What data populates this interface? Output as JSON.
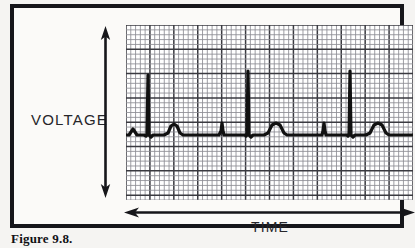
{
  "figure": {
    "caption": "Figure 9.8.",
    "y_axis_label": "VOLTAGE",
    "x_axis_label": "TIME",
    "y_arrow_icon": "double-headed-vertical-arrow-icon",
    "x_arrow_icon": "double-headed-horizontal-arrow-icon",
    "frame_color": "#16161a",
    "background_color": "#f5f4f2",
    "paper_color": "#ffffff",
    "trace_color": "#111111",
    "grid_minor_color": "#8d8d93",
    "grid_major_color": "#3a3a40"
  },
  "chart_data": {
    "type": "line",
    "title": "",
    "subtitle": "",
    "xlabel": "TIME",
    "ylabel": "VOLTAGE",
    "grid": true,
    "grid_minor_divisions_x": 60,
    "grid_minor_divisions_y": 36,
    "grid_major_every": 5,
    "legend": null,
    "axis_ticks_shown": false,
    "xlim": [
      0,
      287
    ],
    "ylim": [
      0,
      175
    ],
    "baseline_y": 110,
    "series": [
      {
        "name": "ECG waveform",
        "description": "Electrocardiogram trace: repeating P-QRS-T complexes with tall R spikes, rounded T waves and small intervening deflections",
        "beats": [
          {
            "r_spike_x": 22,
            "r_spike_height": 62,
            "t_wave_x": 48,
            "t_wave_height": 13,
            "small_spike_x": 0,
            "small_spike_height": 0
          },
          {
            "r_spike_x": 0,
            "r_spike_height": 0,
            "t_wave_x": 0,
            "t_wave_height": 0,
            "small_spike_x": 96,
            "small_spike_height": 12
          },
          {
            "r_spike_x": 122,
            "r_spike_height": 64,
            "t_wave_x": 150,
            "t_wave_height": 14,
            "small_spike_x": 0,
            "small_spike_height": 0
          },
          {
            "r_spike_x": 0,
            "r_spike_height": 0,
            "t_wave_x": 0,
            "t_wave_height": 0,
            "small_spike_x": 198,
            "small_spike_height": 12
          },
          {
            "r_spike_x": 224,
            "r_spike_height": 64,
            "t_wave_x": 252,
            "t_wave_height": 14,
            "small_spike_x": 0,
            "small_spike_height": 0
          }
        ],
        "points": [
          [
            0,
            110
          ],
          [
            3,
            110
          ],
          [
            5,
            107
          ],
          [
            7,
            104
          ],
          [
            9,
            107
          ],
          [
            11,
            110
          ],
          [
            14,
            110
          ],
          [
            18,
            110
          ],
          [
            20,
            111
          ],
          [
            21,
            110
          ],
          [
            22,
            50
          ],
          [
            23,
            110
          ],
          [
            25,
            112
          ],
          [
            27,
            110
          ],
          [
            32,
            110
          ],
          [
            38,
            110
          ],
          [
            42,
            108
          ],
          [
            45,
            101
          ],
          [
            48,
            99
          ],
          [
            51,
            101
          ],
          [
            54,
            108
          ],
          [
            57,
            110
          ],
          [
            64,
            110
          ],
          [
            74,
            110
          ],
          [
            84,
            110
          ],
          [
            90,
            110
          ],
          [
            93,
            110
          ],
          [
            95,
            106
          ],
          [
            96,
            98
          ],
          [
            97,
            106
          ],
          [
            98,
            110
          ],
          [
            103,
            110
          ],
          [
            110,
            110
          ],
          [
            116,
            110
          ],
          [
            119,
            110
          ],
          [
            120,
            111
          ],
          [
            121,
            110
          ],
          [
            122,
            46
          ],
          [
            123,
            110
          ],
          [
            125,
            112
          ],
          [
            127,
            110
          ],
          [
            132,
            110
          ],
          [
            138,
            110
          ],
          [
            142,
            108
          ],
          [
            146,
            100
          ],
          [
            150,
            98
          ],
          [
            154,
            100
          ],
          [
            158,
            108
          ],
          [
            161,
            110
          ],
          [
            168,
            110
          ],
          [
            178,
            110
          ],
          [
            188,
            110
          ],
          [
            193,
            110
          ],
          [
            196,
            110
          ],
          [
            197,
            106
          ],
          [
            198,
            98
          ],
          [
            199,
            106
          ],
          [
            200,
            110
          ],
          [
            205,
            110
          ],
          [
            212,
            110
          ],
          [
            218,
            110
          ],
          [
            221,
            110
          ],
          [
            222,
            111
          ],
          [
            223,
            110
          ],
          [
            224,
            46
          ],
          [
            225,
            110
          ],
          [
            227,
            112
          ],
          [
            229,
            110
          ],
          [
            234,
            110
          ],
          [
            240,
            110
          ],
          [
            244,
            108
          ],
          [
            248,
            100
          ],
          [
            252,
            98
          ],
          [
            256,
            100
          ],
          [
            260,
            108
          ],
          [
            263,
            110
          ],
          [
            270,
            110
          ],
          [
            280,
            110
          ],
          [
            287,
            110
          ]
        ]
      }
    ]
  }
}
